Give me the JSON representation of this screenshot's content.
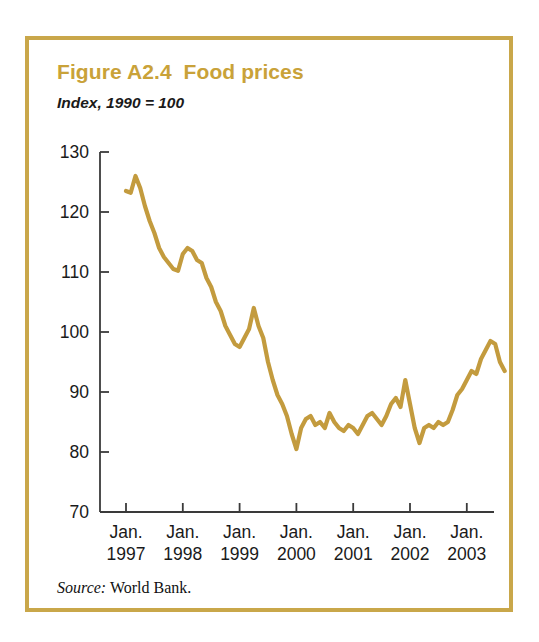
{
  "figure": {
    "title": "Figure A2.4  Food prices",
    "subtitle": "Index, 1990 = 100",
    "source_label": "Source:",
    "source_text": " World Bank.",
    "frame_color": "#C9A74A",
    "title_color": "#C9A239",
    "line_color": "#C39B3E"
  },
  "chart_data": {
    "type": "line",
    "title": "Figure A2.4  Food prices",
    "subtitle": "Index, 1990 = 100",
    "xlabel": "",
    "ylabel": "",
    "ylim": [
      70,
      130
    ],
    "yticks": [
      130,
      120,
      110,
      100,
      90,
      80,
      70
    ],
    "ytick_labels": [
      "130",
      "120",
      "110",
      "100",
      "90",
      "80",
      "70"
    ],
    "grid": false,
    "legend": null,
    "xtick_labels": [
      {
        "month": "Jan.",
        "year": "1997"
      },
      {
        "month": "Jan.",
        "year": "1998"
      },
      {
        "month": "Jan.",
        "year": "1999"
      },
      {
        "month": "Jan.",
        "year": "2000"
      },
      {
        "month": "Jan.",
        "year": "2001"
      },
      {
        "month": "Jan.",
        "year": "2002"
      },
      {
        "month": "Jan.",
        "year": "2003"
      }
    ],
    "xlim": [
      "1997-01",
      "2003-10"
    ],
    "x_tick_positions": [
      0,
      12,
      24,
      36,
      48,
      60,
      72
    ],
    "series": [
      {
        "name": "Food price index",
        "color": "#C39B3E",
        "x": [
          0,
          1,
          2,
          3,
          4,
          5,
          6,
          7,
          8,
          9,
          10,
          11,
          12,
          13,
          14,
          15,
          16,
          17,
          18,
          19,
          20,
          21,
          22,
          23,
          24,
          25,
          26,
          27,
          28,
          29,
          30,
          31,
          32,
          33,
          34,
          35,
          36,
          37,
          38,
          39,
          40,
          41,
          42,
          43,
          44,
          45,
          46,
          47,
          48,
          49,
          50,
          51,
          52,
          53,
          54,
          55,
          56,
          57,
          58,
          59,
          60,
          61,
          62,
          63,
          64,
          65,
          66,
          67,
          68,
          69,
          70,
          71,
          72,
          73,
          74,
          75,
          76,
          77,
          78,
          79,
          80
        ],
        "values": [
          123.5,
          123.2,
          126.0,
          124.0,
          121.0,
          118.5,
          116.5,
          114.0,
          112.5,
          111.5,
          110.5,
          110.2,
          113.0,
          114.0,
          113.5,
          112.0,
          111.5,
          109.0,
          107.5,
          105.0,
          103.5,
          101.0,
          99.5,
          98.0,
          97.5,
          99.0,
          100.5,
          104.0,
          101.0,
          99.0,
          95.0,
          92.0,
          89.5,
          88.0,
          86.0,
          83.0,
          80.5,
          84.0,
          85.5,
          86.0,
          84.5,
          85.0,
          84.0,
          86.5,
          85.0,
          84.0,
          83.5,
          84.5,
          84.0,
          83.0,
          84.5,
          86.0,
          86.5,
          85.5,
          84.5,
          86.0,
          88.0,
          89.0,
          87.5,
          92.0,
          88.0,
          84.0,
          81.5,
          84.0,
          84.5,
          84.0,
          85.0,
          84.5,
          85.0,
          87.0,
          89.5,
          90.5,
          92.0,
          93.5,
          93.0,
          95.5,
          97.0,
          98.5,
          98.0,
          95.0,
          93.5
        ]
      }
    ]
  }
}
